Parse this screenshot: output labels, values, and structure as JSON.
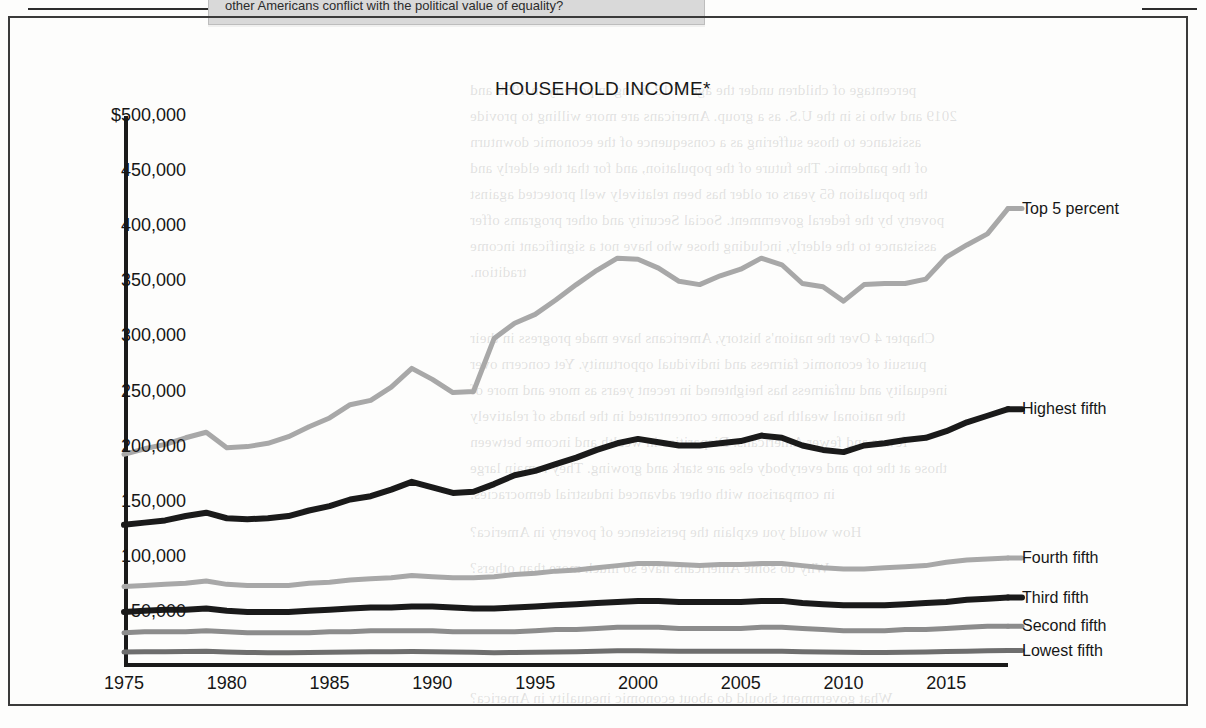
{
  "page": {
    "callout_text": "other Americans conflict with the political value of equality?",
    "bleed_lines": [
      {
        "t": "percentage of children under the age of 18 living in poverty in 1959 and",
        "x": 470,
        "y": 82
      },
      {
        "t": "2019 and who is in the U.S. as a group. Americans are more willing to provide",
        "x": 470,
        "y": 108
      },
      {
        "t": "assistance to those suffering as a consequence of the economic downturn",
        "x": 470,
        "y": 134
      },
      {
        "t": "of the pandemic. The future of the population, and for that the elderly and",
        "x": 470,
        "y": 160
      },
      {
        "t": "the population 65 years or older has been relatively well protected against",
        "x": 470,
        "y": 186
      },
      {
        "t": "poverty by the federal government. Social Security and other programs offer",
        "x": 470,
        "y": 212
      },
      {
        "t": "assistance to the elderly, including those who have not a significant income",
        "x": 470,
        "y": 238
      },
      {
        "t": "tradition.",
        "x": 470,
        "y": 264
      },
      {
        "t": "Chapter 4  Over the nation's history, Americans have made progress in their",
        "x": 470,
        "y": 330
      },
      {
        "t": "pursuit of economic fairness and individual opportunity. Yet concern over",
        "x": 470,
        "y": 356
      },
      {
        "t": "inequality and unfairness has heightened in recent years as more and more of",
        "x": 470,
        "y": 382
      },
      {
        "t": "the national wealth has become concentrated in the hands of relatively",
        "x": 470,
        "y": 408
      },
      {
        "t": "fewer and fewer Americans. Disparities in wealth and income between",
        "x": 470,
        "y": 434
      },
      {
        "t": "those at the top and everybody else are stark and growing. They remain large",
        "x": 470,
        "y": 460
      },
      {
        "t": "in comparison with other advanced industrial democracies.",
        "x": 470,
        "y": 486
      },
      {
        "t": "How would you explain the persistence of poverty in America?",
        "x": 470,
        "y": 524
      },
      {
        "t": "Why do some Americans have so much more than others?",
        "x": 470,
        "y": 560
      },
      {
        "t": "What government should do about economic inequality in America?",
        "x": 470,
        "y": 690
      }
    ]
  },
  "chart_data": {
    "type": "line",
    "title": "HOUSEHOLD INCOME*",
    "xlabel": "",
    "ylabel": "",
    "xlim": [
      1975,
      2018
    ],
    "ylim": [
      0,
      500000
    ],
    "grid": false,
    "legend_position": "right-of-line-ends",
    "y_ticks": [
      {
        "value": 500000,
        "label": "$500,000"
      },
      {
        "value": 450000,
        "label": "450,000"
      },
      {
        "value": 400000,
        "label": "400,000"
      },
      {
        "value": 350000,
        "label": "350,000"
      },
      {
        "value": 300000,
        "label": "300,000"
      },
      {
        "value": 250000,
        "label": "250,000"
      },
      {
        "value": 200000,
        "label": "200,000"
      },
      {
        "value": 150000,
        "label": "150,000"
      },
      {
        "value": 100000,
        "label": "100,000"
      },
      {
        "value": 50000,
        "label": "50,000"
      }
    ],
    "x_ticks": [
      {
        "value": 1975,
        "label": "1975"
      },
      {
        "value": 1980,
        "label": "1980"
      },
      {
        "value": 1985,
        "label": "1985"
      },
      {
        "value": 1990,
        "label": "1990"
      },
      {
        "value": 1995,
        "label": "1995"
      },
      {
        "value": 2000,
        "label": "2000"
      },
      {
        "value": 2005,
        "label": "2005"
      },
      {
        "value": 2010,
        "label": "2010"
      },
      {
        "value": 2015,
        "label": "2015"
      }
    ],
    "x": [
      1975,
      1976,
      1977,
      1978,
      1979,
      1980,
      1981,
      1982,
      1983,
      1984,
      1985,
      1986,
      1987,
      1988,
      1989,
      1990,
      1991,
      1992,
      1993,
      1994,
      1995,
      1996,
      1997,
      1998,
      1999,
      2000,
      2001,
      2002,
      2003,
      2004,
      2005,
      2006,
      2007,
      2008,
      2009,
      2010,
      2011,
      2012,
      2013,
      2014,
      2015,
      2016,
      2017,
      2018
    ],
    "series": [
      {
        "name": "Top 5 percent",
        "color": "#a8a8a8",
        "width": 5,
        "values": [
          193000,
          198000,
          202000,
          208000,
          213000,
          199000,
          200000,
          203000,
          209000,
          218000,
          226000,
          238000,
          242000,
          254000,
          271000,
          261000,
          249000,
          250000,
          298000,
          312000,
          320000,
          333000,
          347000,
          360000,
          371000,
          370000,
          362000,
          350000,
          347000,
          355000,
          361000,
          371000,
          365000,
          348000,
          345000,
          332000,
          347000,
          348000,
          348000,
          352000,
          372000,
          383000,
          393000,
          416000
        ]
      },
      {
        "name": "Highest fifth",
        "color": "#1a1a1a",
        "width": 6,
        "values": [
          129000,
          131000,
          133000,
          137000,
          140000,
          135000,
          134000,
          135000,
          137000,
          142000,
          146000,
          152000,
          155000,
          161000,
          168000,
          163000,
          158000,
          159000,
          166000,
          174000,
          178000,
          184000,
          190000,
          197000,
          203000,
          207000,
          204000,
          201000,
          201000,
          203000,
          205000,
          210000,
          208000,
          201000,
          197000,
          195000,
          201000,
          203000,
          206000,
          208000,
          214000,
          222000,
          228000,
          234000
        ]
      },
      {
        "name": "Fourth fifth",
        "color": "#a8a8a8",
        "width": 5,
        "values": [
          73000,
          74000,
          75000,
          76000,
          78000,
          75000,
          74000,
          74000,
          74000,
          76000,
          77000,
          79000,
          80000,
          81000,
          83000,
          82000,
          81000,
          81000,
          82000,
          84000,
          85000,
          87000,
          88000,
          90000,
          92000,
          94000,
          94000,
          93000,
          92000,
          93000,
          93000,
          94000,
          94000,
          92000,
          90000,
          89000,
          89000,
          90000,
          91000,
          92000,
          95000,
          97000,
          98000,
          99000
        ]
      },
      {
        "name": "Third fifth",
        "color": "#1a1a1a",
        "width": 6,
        "values": [
          50000,
          51000,
          52000,
          52000,
          53000,
          51000,
          50000,
          50000,
          50000,
          51000,
          52000,
          53000,
          54000,
          54000,
          55000,
          55000,
          54000,
          53000,
          53000,
          54000,
          55000,
          56000,
          57000,
          58000,
          59000,
          60000,
          60000,
          59000,
          59000,
          59000,
          59000,
          60000,
          60000,
          58000,
          57000,
          56000,
          56000,
          56000,
          57000,
          58000,
          59000,
          61000,
          62000,
          63000
        ]
      },
      {
        "name": "Second fifth",
        "color": "#8c8c8c",
        "width": 5,
        "values": [
          31000,
          32000,
          32000,
          32000,
          33000,
          32000,
          31000,
          31000,
          31000,
          31000,
          32000,
          32000,
          33000,
          33000,
          33000,
          33000,
          32000,
          32000,
          32000,
          32000,
          33000,
          34000,
          34000,
          35000,
          36000,
          36000,
          36000,
          35000,
          35000,
          35000,
          35000,
          36000,
          36000,
          35000,
          34000,
          33000,
          33000,
          33000,
          34000,
          34000,
          35000,
          36000,
          37000,
          37000
        ]
      },
      {
        "name": "Lowest fifth",
        "color": "#6e6e6e",
        "width": 5,
        "values": [
          13500,
          13800,
          13900,
          14000,
          14200,
          13600,
          13200,
          13000,
          13000,
          13200,
          13400,
          13600,
          13800,
          13900,
          14100,
          13900,
          13500,
          13300,
          13000,
          13100,
          13400,
          13600,
          13900,
          14300,
          14700,
          14800,
          14600,
          14400,
          14300,
          14200,
          14200,
          14400,
          14400,
          13900,
          13600,
          13300,
          13200,
          13200,
          13400,
          13500,
          14000,
          14400,
          14700,
          14900
        ]
      }
    ]
  }
}
